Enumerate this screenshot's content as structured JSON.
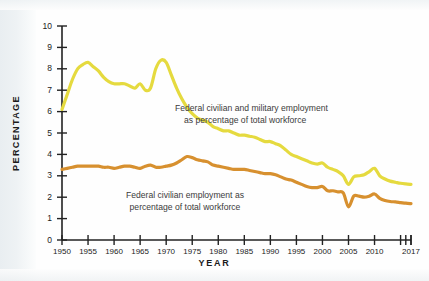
{
  "chart_data": {
    "type": "line",
    "title": "",
    "xlabel": "YEAR",
    "ylabel": "PERCENTAGE",
    "xlim": [
      1950,
      2017
    ],
    "ylim": [
      0,
      10
    ],
    "grid": false,
    "legend": "inline-annotations",
    "x_tick_labels": [
      "1950",
      "1955",
      "1960",
      "1965",
      "1970",
      "1975",
      "1980",
      "1985",
      "1990",
      "1995",
      "2000",
      "2005",
      "2010",
      "2017"
    ],
    "x_tick_values": [
      1950,
      1955,
      1960,
      1965,
      1970,
      1975,
      1980,
      1985,
      1990,
      1995,
      2000,
      2005,
      2010,
      2017
    ],
    "x_minor_tick_values": [
      2015,
      2016,
      2017
    ],
    "y_tick_labels": [
      "0",
      "1",
      "2",
      "3",
      "4",
      "5",
      "6",
      "7",
      "8",
      "9",
      "10"
    ],
    "y_tick_values": [
      0,
      1,
      2,
      3,
      4,
      5,
      6,
      7,
      8,
      9,
      10
    ],
    "series": [
      {
        "name": "Federal civilian and military employment as percentage of total workforce",
        "color": "#e5da3f",
        "annotation_line1": "Federal civilian and military employment",
        "annotation_line2": "as percentage of total workforce",
        "x": [
          1950,
          1951,
          1952,
          1953,
          1954,
          1955,
          1956,
          1957,
          1958,
          1959,
          1960,
          1961,
          1962,
          1963,
          1964,
          1965,
          1966,
          1967,
          1968,
          1969,
          1970,
          1971,
          1972,
          1973,
          1974,
          1975,
          1976,
          1977,
          1978,
          1979,
          1980,
          1981,
          1982,
          1983,
          1984,
          1985,
          1986,
          1987,
          1988,
          1989,
          1990,
          1991,
          1992,
          1993,
          1994,
          1995,
          1996,
          1997,
          1998,
          1999,
          2000,
          2001,
          2002,
          2003,
          2004,
          2005,
          2006,
          2007,
          2008,
          2009,
          2010,
          2011,
          2012,
          2013,
          2014,
          2015,
          2016,
          2017
        ],
        "y": [
          6.1,
          6.8,
          7.5,
          8.0,
          8.2,
          8.3,
          8.1,
          7.9,
          7.6,
          7.4,
          7.3,
          7.3,
          7.3,
          7.2,
          7.1,
          7.3,
          7.0,
          7.1,
          8.0,
          8.4,
          8.3,
          7.7,
          7.1,
          6.6,
          6.2,
          5.9,
          5.7,
          5.6,
          5.5,
          5.3,
          5.2,
          5.1,
          5.1,
          5.0,
          4.9,
          4.9,
          4.85,
          4.8,
          4.7,
          4.6,
          4.6,
          4.5,
          4.4,
          4.2,
          4.0,
          3.9,
          3.8,
          3.7,
          3.6,
          3.55,
          3.6,
          3.4,
          3.3,
          3.2,
          3.0,
          2.6,
          2.95,
          3.0,
          3.05,
          3.2,
          3.35,
          3.0,
          2.85,
          2.75,
          2.7,
          2.65,
          2.62,
          2.6
        ]
      },
      {
        "name": "Federal civilian employment as percentage of total workforce",
        "color": "#d7902f",
        "annotation_line1": "Federal civilian employment as",
        "annotation_line2": "percentage of total workforce",
        "x": [
          1950,
          1951,
          1952,
          1953,
          1954,
          1955,
          1956,
          1957,
          1958,
          1959,
          1960,
          1961,
          1962,
          1963,
          1964,
          1965,
          1966,
          1967,
          1968,
          1969,
          1970,
          1971,
          1972,
          1973,
          1974,
          1975,
          1976,
          1977,
          1978,
          1979,
          1980,
          1981,
          1982,
          1983,
          1984,
          1985,
          1986,
          1987,
          1988,
          1989,
          1990,
          1991,
          1992,
          1993,
          1994,
          1995,
          1996,
          1997,
          1998,
          1999,
          2000,
          2001,
          2002,
          2003,
          2004,
          2005,
          2006,
          2007,
          2008,
          2009,
          2010,
          2011,
          2012,
          2013,
          2014,
          2015,
          2016,
          2017
        ],
        "y": [
          3.3,
          3.35,
          3.4,
          3.45,
          3.45,
          3.45,
          3.45,
          3.45,
          3.4,
          3.4,
          3.35,
          3.4,
          3.45,
          3.45,
          3.4,
          3.35,
          3.45,
          3.5,
          3.4,
          3.4,
          3.45,
          3.5,
          3.6,
          3.75,
          3.9,
          3.85,
          3.75,
          3.7,
          3.65,
          3.5,
          3.45,
          3.4,
          3.35,
          3.3,
          3.3,
          3.3,
          3.25,
          3.2,
          3.15,
          3.1,
          3.1,
          3.05,
          2.95,
          2.85,
          2.8,
          2.7,
          2.6,
          2.5,
          2.45,
          2.45,
          2.5,
          2.3,
          2.3,
          2.25,
          2.2,
          1.55,
          2.05,
          2.05,
          2.0,
          2.05,
          2.15,
          1.95,
          1.85,
          1.8,
          1.78,
          1.75,
          1.72,
          1.7
        ]
      }
    ]
  }
}
